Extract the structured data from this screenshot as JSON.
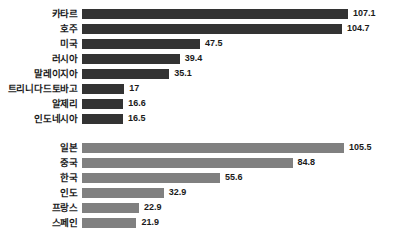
{
  "chart_data": {
    "type": "bar",
    "orientation": "horizontal",
    "title": "",
    "subtitle": "",
    "xlabel": "",
    "ylabel": "",
    "grid": false,
    "legend": false,
    "legend_position": "none",
    "xlim": [
      0,
      107.1
    ],
    "colors": {
      "group_1_bar": "#333333",
      "group_2_bar": "#808080",
      "background": "#ffffff",
      "text": "#1a1a1a"
    },
    "groups": [
      {
        "name": "group-1",
        "color": "#333333",
        "categories": [
          "카타르",
          "호주",
          "미국",
          "러시아",
          "말레이지아",
          "트리니다드토바고",
          "알제리",
          "인도네시아"
        ],
        "values": [
          107.1,
          104.7,
          47.5,
          39.4,
          35.1,
          17,
          16.6,
          16.5
        ],
        "value_labels": [
          "107.1",
          "104.7",
          "47.5",
          "39.4",
          "35.1",
          "17",
          "16.6",
          "16.5"
        ]
      },
      {
        "name": "group-2",
        "color": "#808080",
        "categories": [
          "일본",
          "중국",
          "한국",
          "인도",
          "프랑스",
          "스페인"
        ],
        "values": [
          105.5,
          84.8,
          55.6,
          32.9,
          22.9,
          21.9
        ],
        "value_labels": [
          "105.5",
          "84.8",
          "55.6",
          "32.9",
          "22.9",
          "21.9"
        ]
      }
    ]
  }
}
